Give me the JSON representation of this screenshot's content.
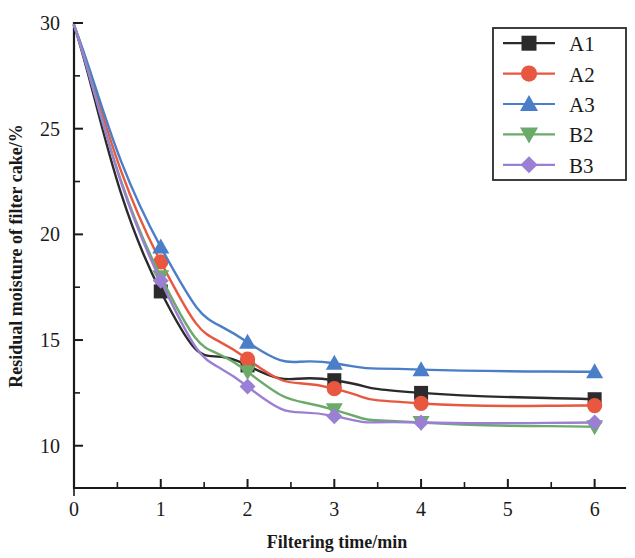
{
  "chart_data": {
    "type": "line",
    "title": "",
    "xlabel": "Filtering time/min",
    "ylabel": "Residual moisture of filter cake/%",
    "xlim": [
      0,
      6.35
    ],
    "ylim": [
      8.0,
      30
    ],
    "grid": false,
    "legend_position": "top-right",
    "x_ticks": [
      0,
      1,
      2,
      3,
      4,
      5,
      6
    ],
    "x_tick_labels": [
      "0",
      "1",
      "2",
      "3",
      "4",
      "5",
      "6"
    ],
    "x_minor_ticks": [
      0.5,
      1.5,
      2.5,
      3.5,
      4.5,
      5.5
    ],
    "y_ticks": [
      10,
      15,
      20,
      25,
      30
    ],
    "y_tick_labels": [
      "10",
      "15",
      "20",
      "25",
      "30"
    ],
    "y_minor_ticks": [
      12.5,
      17.5,
      22.5,
      27.5
    ],
    "x": [
      0,
      1,
      2,
      3,
      4,
      6
    ],
    "series": [
      {
        "name": "A1",
        "color": "#2b2b2b",
        "marker": "square",
        "values": [
          29.9,
          17.3,
          13.8,
          13.1,
          12.5,
          12.2
        ]
      },
      {
        "name": "A2",
        "color": "#e8573f",
        "marker": "circle",
        "values": [
          29.9,
          18.7,
          14.1,
          12.7,
          12.0,
          11.9
        ]
      },
      {
        "name": "A3",
        "color": "#4a7ec8",
        "marker": "triangle-up",
        "values": [
          29.9,
          19.4,
          14.9,
          13.9,
          13.6,
          13.5
        ]
      },
      {
        "name": "B2",
        "color": "#6aab6a",
        "marker": "triangle-down",
        "values": [
          29.9,
          18.0,
          13.5,
          11.7,
          11.1,
          10.9
        ]
      },
      {
        "name": "B3",
        "color": "#9b7fd4",
        "marker": "diamond",
        "values": [
          29.9,
          17.8,
          12.8,
          11.4,
          11.1,
          11.1
        ]
      }
    ]
  },
  "axes": {
    "x_title": "Filtering time/min",
    "y_title": "Residual moisture of filter cake/%"
  },
  "legend": {
    "entries": [
      {
        "label": "A1"
      },
      {
        "label": "A2"
      },
      {
        "label": "A3"
      },
      {
        "label": "B2"
      },
      {
        "label": "B3"
      }
    ]
  }
}
